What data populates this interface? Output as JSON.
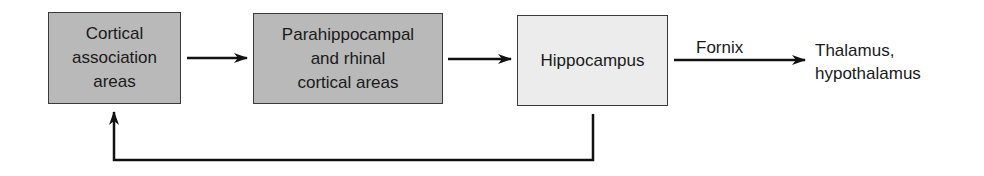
{
  "diagram": {
    "nodes": [
      {
        "id": "cortical",
        "label": "Cortical\nassociation\nareas",
        "fill": "#b9b9b9"
      },
      {
        "id": "parahippocampal",
        "label": "Parahippocampal\nand rhinal\ncortical areas",
        "fill": "#b9b9b9"
      },
      {
        "id": "hippocampus",
        "label": "Hippocampus",
        "fill": "#ececec"
      },
      {
        "id": "thalamus",
        "label": "Thalamus,\nhypothalamus"
      }
    ],
    "edges": [
      {
        "from": "cortical",
        "to": "parahippocampal",
        "label": ""
      },
      {
        "from": "parahippocampal",
        "to": "hippocampus",
        "label": ""
      },
      {
        "from": "hippocampus",
        "to": "thalamus",
        "label": "Fornix"
      },
      {
        "from": "hippocampus",
        "to": "cortical",
        "label": ""
      }
    ],
    "edge_label_fornix": "Fornix"
  }
}
